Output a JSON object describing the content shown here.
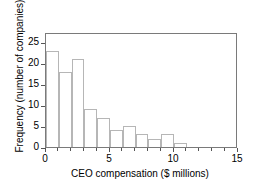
{
  "chart_data": {
    "type": "bar",
    "title": "",
    "xlabel": "CEO compensation ($ millions)",
    "ylabel": "Frequency (number of companies)",
    "xlim": [
      0,
      15
    ],
    "ylim": [
      0,
      27.5
    ],
    "grid": false,
    "legend": null,
    "bin_width": 1,
    "xticks": [
      0,
      5,
      10,
      15
    ],
    "xticks_labels": [
      "0",
      "5",
      "10",
      "15"
    ],
    "xminor_ticks": [
      1,
      2,
      3,
      4,
      6,
      7,
      8,
      9,
      11,
      12,
      13,
      14
    ],
    "yticks": [
      0,
      5,
      10,
      15,
      20,
      25
    ],
    "yticks_labels": [
      "0",
      "5",
      "10",
      "15",
      "20",
      "25"
    ],
    "categories": [
      "0-1",
      "1-2",
      "2-3",
      "3-4",
      "4-5",
      "5-6",
      "6-7",
      "7-8",
      "8-9",
      "9-10",
      "10-11"
    ],
    "bin_starts": [
      0,
      1,
      2,
      3,
      4,
      5,
      6,
      7,
      8,
      9,
      10
    ],
    "bin_ends": [
      1,
      2,
      3,
      4,
      5,
      6,
      7,
      8,
      9,
      10,
      11
    ],
    "values": [
      23,
      18,
      21,
      9,
      7,
      4,
      5,
      3,
      2,
      3,
      1
    ],
    "colors": {
      "bar_fill": "#ffffff",
      "bar_edge": "#b6b6b6",
      "frame": "#7a7a7a",
      "axis_text": "#000000",
      "background": "#ffffff"
    }
  }
}
